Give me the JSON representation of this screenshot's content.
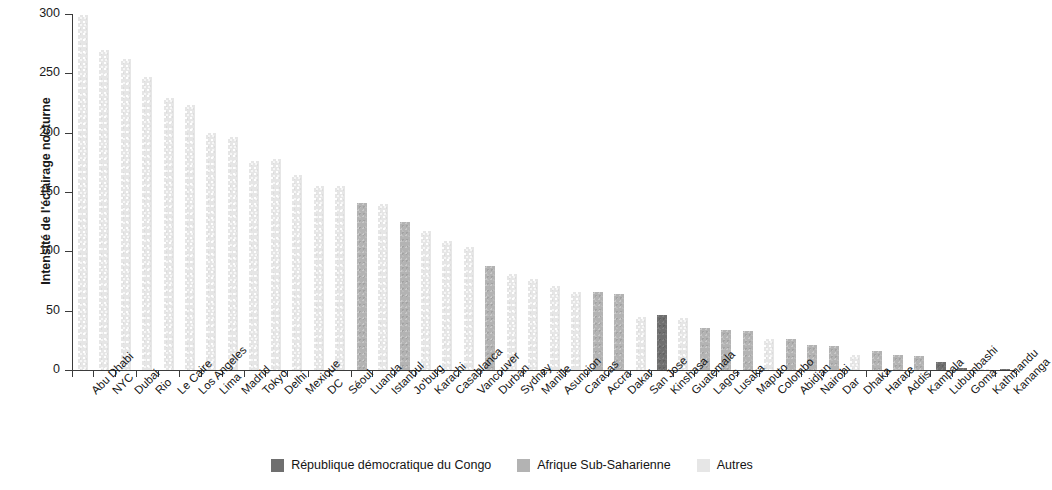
{
  "chart_data": {
    "type": "bar",
    "title": "",
    "xlabel": "",
    "ylabel": "Intensité de l'éclairage nocturne",
    "ylim": [
      0,
      300
    ],
    "yticks": [
      0,
      50,
      100,
      150,
      200,
      250,
      300
    ],
    "grid": false,
    "legend_position": "bottom-center",
    "categories": [
      "Abu Dhabi",
      "NYC",
      "Dubai",
      "Rio",
      "Le Caire",
      "Los Angeles",
      "Lima",
      "Madrid",
      "Tokyo",
      "Delhi",
      "Mexique",
      "DC",
      "Séoul",
      "Luanda",
      "Istanbul",
      "Jo'burg",
      "Karachi",
      "Casablanca",
      "Vancouver",
      "Durban",
      "Sydney",
      "Manille",
      "Asuncion",
      "Caracas",
      "Accra",
      "Dakar",
      "San Jose",
      "Kinshasa",
      "Guatemala",
      "Lagos",
      "Lusaka",
      "Maputo",
      "Colombo",
      "Abidjan",
      "Nairobi",
      "Dar",
      "Dhaka",
      "Harare",
      "Addis",
      "Kampala",
      "Lubumbashi",
      "Goma",
      "Kathmandu",
      "Kananga"
    ],
    "values": [
      299,
      270,
      262,
      247,
      229,
      223,
      200,
      196,
      176,
      178,
      164,
      155,
      155,
      141,
      140,
      125,
      117,
      109,
      104,
      88,
      81,
      77,
      71,
      66,
      66,
      64,
      45,
      46,
      44,
      35,
      34,
      33,
      26,
      26,
      21,
      20,
      13,
      16,
      13,
      12,
      7,
      1.5,
      0.8,
      0.4
    ],
    "series_groups": [
      "other",
      "other",
      "other",
      "other",
      "other",
      "other",
      "other",
      "other",
      "other",
      "other",
      "other",
      "other",
      "other",
      "ssa",
      "other",
      "ssa",
      "other",
      "other",
      "other",
      "ssa",
      "other",
      "other",
      "other",
      "other",
      "ssa",
      "ssa",
      "other",
      "drc",
      "other",
      "ssa",
      "ssa",
      "ssa",
      "other",
      "ssa",
      "ssa",
      "ssa",
      "other",
      "ssa",
      "ssa",
      "ssa",
      "drc",
      "drc",
      "other",
      "drc"
    ]
  },
  "legend": {
    "entries": [
      {
        "key": "drc",
        "label": "République démocratique du Congo",
        "color": "#6f6f6f"
      },
      {
        "key": "ssa",
        "label": "Afrique Sub-Saharienne",
        "color": "#b3b3b3"
      },
      {
        "key": "other",
        "label": "Autres",
        "color": "#e6e6e6"
      }
    ]
  }
}
